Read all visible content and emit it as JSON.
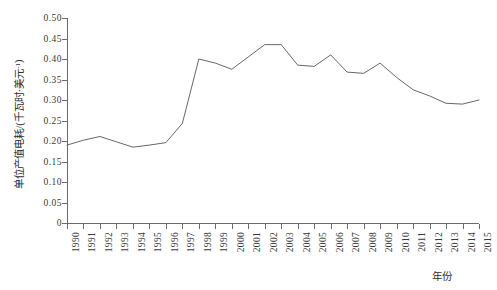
{
  "chart_data": {
    "type": "line",
    "title": "",
    "xlabel": "年份",
    "ylabel": "单位产值电耗/(千瓦时·美元⁻¹)",
    "ylabel_main": "单位产值电耗/(千瓦时·美元",
    "ylabel_sup": "-1",
    "ylabel_tail": ")",
    "grid": false,
    "legend": false,
    "xlim": [
      1990,
      2015
    ],
    "ylim": [
      0,
      0.5
    ],
    "ytick_labels": [
      "0.50",
      "0.45",
      "0.40",
      "0.35",
      "0.30",
      "0.25",
      "0.20",
      "0.15",
      "0.10",
      "0.05",
      "0"
    ],
    "ytick_values": [
      0.5,
      0.45,
      0.4,
      0.35,
      0.3,
      0.25,
      0.2,
      0.15,
      0.1,
      0.05,
      0
    ],
    "categories": [
      "1990",
      "1991",
      "1992",
      "1993",
      "1994",
      "1995",
      "1996",
      "1997",
      "1998",
      "1999",
      "2000",
      "2001",
      "2002",
      "2003",
      "2004",
      "2005",
      "2006",
      "2007",
      "2008",
      "2009",
      "2010",
      "2011",
      "2012",
      "2013",
      "2014",
      "2015"
    ],
    "values": [
      0.19,
      0.202,
      0.211,
      0.198,
      0.185,
      0.19,
      0.196,
      0.243,
      0.4,
      0.39,
      0.375,
      0.405,
      0.435,
      0.435,
      0.385,
      0.382,
      0.41,
      0.368,
      0.365,
      0.39,
      0.355,
      0.325,
      0.31,
      0.292,
      0.29,
      0.3
    ],
    "series_name": "单位产值电耗",
    "line_color": "#565656",
    "line_width": 0.9
  }
}
